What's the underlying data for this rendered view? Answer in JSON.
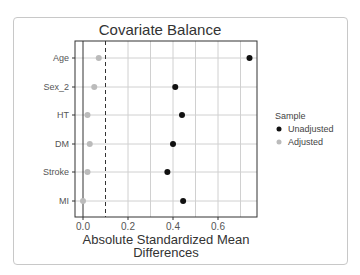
{
  "chart_data": {
    "type": "scatter",
    "title": "Covariate Balance",
    "xlabel": "Absolute Standardized Mean Differences",
    "xlabel_lines": [
      "Absolute Standardized Mean",
      "Differences"
    ],
    "ylabel": "",
    "categories": [
      "Age",
      "Sex_2",
      "HT",
      "DM",
      "Stroke",
      "MI"
    ],
    "series": [
      {
        "name": "Unadjusted",
        "color": "#111111",
        "values": [
          0.74,
          0.41,
          0.44,
          0.4,
          0.375,
          0.445
        ]
      },
      {
        "name": "Adjusted",
        "color": "#bbbbbb",
        "values": [
          0.07,
          0.05,
          0.02,
          0.03,
          0.02,
          0.0
        ]
      }
    ],
    "xticks": [
      "0.0",
      "0.2",
      "0.4",
      "0.6"
    ],
    "xlim": [
      -0.035,
      0.775
    ],
    "threshold_line": 0.1,
    "grid": true,
    "legend": {
      "title": "Sample",
      "position": "right",
      "entries": [
        "Unadjusted",
        "Adjusted"
      ]
    }
  }
}
